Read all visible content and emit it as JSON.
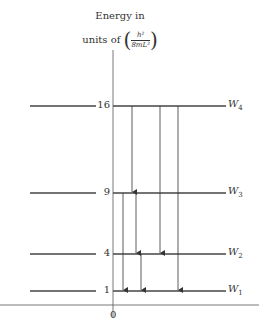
{
  "title": {
    "line1": "Energy in",
    "line2_prefix": "units of",
    "unit_numerator": "h²",
    "unit_denominator": "8mL²"
  },
  "axis": {
    "origin_label": "0"
  },
  "levels": [
    {
      "value": "16",
      "name": "W",
      "sub": "4",
      "y": 106
    },
    {
      "value": "9",
      "name": "W",
      "sub": "3",
      "y": 193
    },
    {
      "value": "4",
      "name": "W",
      "sub": "2",
      "y": 254
    },
    {
      "value": "1",
      "name": "W",
      "sub": "1",
      "y": 291
    }
  ],
  "transitions": [
    {
      "from": "W4",
      "to": "W3",
      "x": 132
    },
    {
      "from": "W4",
      "to": "W2",
      "x": 160
    },
    {
      "from": "W4",
      "to": "W1",
      "x": 178
    },
    {
      "from": "W3",
      "to": "W1",
      "x": 123
    },
    {
      "from": "W3",
      "to": "W2",
      "x": 136
    },
    {
      "from": "W2",
      "to": "W1",
      "x": 141
    }
  ],
  "colors": {
    "line": "#333333",
    "level": "#444444"
  }
}
